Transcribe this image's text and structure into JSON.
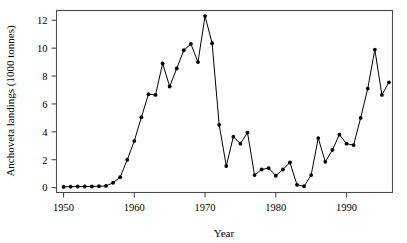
{
  "chart_data": {
    "type": "line",
    "title": "",
    "subtitle": "",
    "xlabel": "Year",
    "ylabel": "Anchoveta landings (1000 tonnes)",
    "xlim": [
      1949,
      1996.5
    ],
    "ylim": [
      -0.35,
      12.7
    ],
    "xticks": [
      1950,
      1960,
      1970,
      1980,
      1990
    ],
    "xtick_labels": [
      "1950",
      "1960",
      "1970",
      "1980",
      "1990"
    ],
    "yticks": [
      0,
      2,
      4,
      6,
      8,
      10,
      12
    ],
    "ytick_labels": [
      "0",
      "2",
      "4",
      "6",
      "8",
      "10",
      "12"
    ],
    "grid": false,
    "legend": "none",
    "marker": "filled-circle",
    "line_color": "#000000",
    "marker_color": "#000000",
    "axis_color": "#4a4a4a",
    "background_color": "#ffffff",
    "series": [
      {
        "name": "Anchoveta landings",
        "x": [
          1950,
          1951,
          1952,
          1953,
          1954,
          1955,
          1956,
          1957,
          1958,
          1959,
          1960,
          1961,
          1962,
          1963,
          1964,
          1965,
          1966,
          1967,
          1968,
          1969,
          1970,
          1971,
          1972,
          1973,
          1974,
          1975,
          1976,
          1977,
          1978,
          1979,
          1980,
          1981,
          1982,
          1983,
          1984,
          1985,
          1986,
          1987,
          1988,
          1989,
          1990,
          1991,
          1992,
          1993,
          1994,
          1995,
          1996
        ],
        "values": [
          0.05,
          0.07,
          0.08,
          0.08,
          0.08,
          0.1,
          0.12,
          0.35,
          0.75,
          2.0,
          3.35,
          5.05,
          6.7,
          6.65,
          8.9,
          7.25,
          8.55,
          9.85,
          10.3,
          9.0,
          12.3,
          10.35,
          4.5,
          1.55,
          3.65,
          3.15,
          3.95,
          0.9,
          1.3,
          1.4,
          0.85,
          1.3,
          1.8,
          0.2,
          0.1,
          0.9,
          3.55,
          1.85,
          2.7,
          3.8,
          3.15,
          3.05,
          5.0,
          7.1,
          9.9,
          6.65,
          7.55
        ]
      }
    ]
  },
  "labels": {
    "x_axis_title": "Year",
    "y_axis_title": "Anchoveta landings (1000 tonnes)"
  }
}
